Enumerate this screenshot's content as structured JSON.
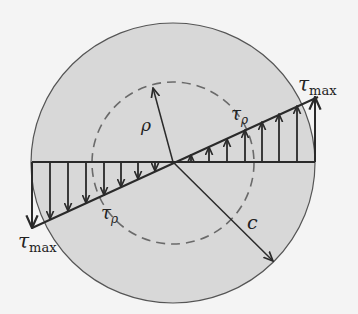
{
  "diagram": {
    "colors": {
      "background": "#f4f4f4",
      "section_fill": "#d8d8d8",
      "outline": "#555555",
      "lines": "#2a2a2a",
      "dashed": "#6a6a6a"
    },
    "labels": {
      "tau_max_top": {
        "symbol": "τ",
        "sub": "max"
      },
      "tau_max_bottom": {
        "symbol": "τ",
        "sub": "max"
      },
      "tau_rho_top": {
        "symbol": "τ",
        "sub": "ρ"
      },
      "tau_rho_bottom": {
        "symbol": "τ",
        "sub": "ρ"
      },
      "rho": "ρ",
      "c": "c"
    }
  }
}
